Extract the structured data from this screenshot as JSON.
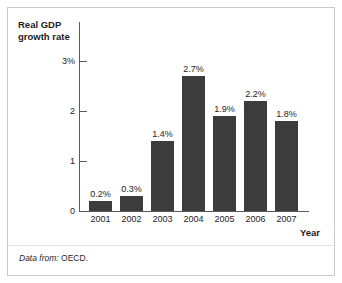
{
  "figure": {
    "source_label": "Data from:",
    "source_value": "OECD."
  },
  "chart_data": {
    "type": "bar",
    "title": "",
    "ylabel": "Real GDP growth rate",
    "xlabel": "Year",
    "categories": [
      "2001",
      "2002",
      "2003",
      "2004",
      "2005",
      "2006",
      "2007"
    ],
    "values": [
      0.2,
      0.3,
      1.4,
      2.7,
      1.9,
      2.2,
      1.8
    ],
    "value_labels": [
      "0.2%",
      "0.3%",
      "1.4%",
      "2.7%",
      "1.9%",
      "2.2%",
      "1.8%"
    ],
    "ylim": [
      0,
      3
    ],
    "y_ticks": [
      0,
      1,
      2,
      3
    ],
    "y_tick_labels": [
      "0",
      "1",
      "2",
      "3%"
    ],
    "grid": false,
    "legend": null,
    "bar_color": "#3c3c3c",
    "axis_color": "#5b5b5b"
  }
}
